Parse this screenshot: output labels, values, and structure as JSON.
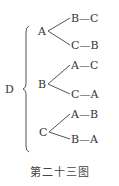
{
  "diagram": {
    "root": "D",
    "branches": [
      {
        "node": "A",
        "leaves": [
          "B—C",
          "C—B"
        ]
      },
      {
        "node": "B",
        "leaves": [
          "A—C",
          "C—A"
        ]
      },
      {
        "node": "C",
        "leaves": [
          "A—B",
          "B—A"
        ]
      }
    ],
    "caption": "第二十三图"
  }
}
